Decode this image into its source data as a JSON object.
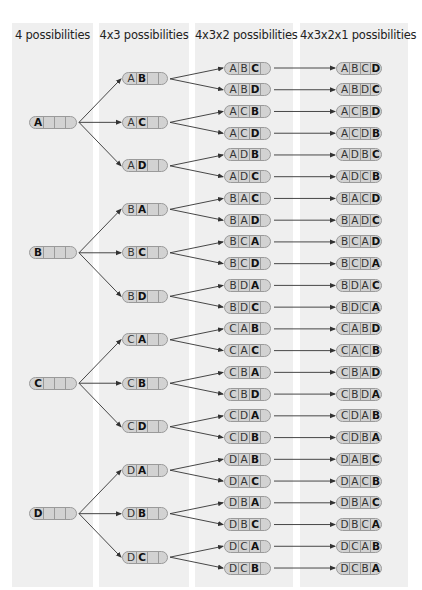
{
  "diagram": {
    "type": "permutation-tree",
    "columns": [
      {
        "title": "4 possibilities"
      },
      {
        "title": "4x3 possibilities"
      },
      {
        "title": "4x3x2 possibilities"
      },
      {
        "title": "4x3x2x1 possibilities"
      }
    ],
    "level1": [
      "A",
      "B",
      "C",
      "D"
    ],
    "level2": [
      "AB",
      "AC",
      "AD",
      "BA",
      "BC",
      "BD",
      "CA",
      "CB",
      "CD",
      "DA",
      "DB",
      "DC"
    ],
    "level3": [
      "ABC",
      "ABD",
      "ACB",
      "ACD",
      "ADB",
      "ADC",
      "BAC",
      "BAD",
      "BCA",
      "BCD",
      "BDA",
      "BDC",
      "CAB",
      "CAC",
      "CBA",
      "CBD",
      "CDA",
      "CDB",
      "DAB",
      "DAC",
      "DBA",
      "DBC",
      "DCA",
      "DCB"
    ],
    "level4": [
      "ABCD",
      "ABDC",
      "ACBD",
      "ACDB",
      "ADBC",
      "ADCB",
      "BACD",
      "BADC",
      "BCAD",
      "BCDA",
      "BDAC",
      "BDCA",
      "CABD",
      "CACB",
      "CBAD",
      "CBDA",
      "CDAB",
      "CDBA",
      "DABC",
      "DACB",
      "DBAC",
      "DBCA",
      "DCAB",
      "DCBA"
    ]
  },
  "colors": {
    "panel": "#efefef",
    "pill_fill": "#d2d2d2",
    "pill_border": "#9a9a9a",
    "line": "#333333"
  }
}
